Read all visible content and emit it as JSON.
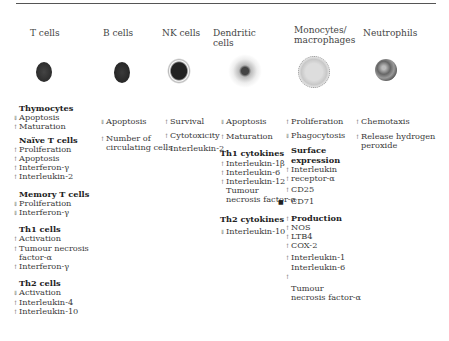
{
  "figure": {
    "columns": [
      {
        "id": "t-cells",
        "title": "T cells",
        "groups": [
          {
            "heading": "Thymocytes",
            "items": [
              {
                "arrow": "down",
                "label": "Apoptosis"
              },
              {
                "arrow": "up",
                "label": "Maturation"
              }
            ]
          },
          {
            "heading": "Naïve T cells",
            "items": [
              {
                "arrow": "up",
                "label": "Proliferation"
              },
              {
                "arrow": "up",
                "label": "Apoptosis"
              },
              {
                "arrow": "up",
                "label": "Interferon-γ"
              },
              {
                "arrow": "up",
                "label": "Interleukin-2"
              }
            ]
          },
          {
            "heading": "Memory T cells",
            "items": [
              {
                "arrow": "down",
                "label": "Proliferation"
              },
              {
                "arrow": "down",
                "label": "Interferon-γ"
              }
            ]
          },
          {
            "heading": "Th1 cells",
            "items": [
              {
                "arrow": "up",
                "label": "Activation"
              },
              {
                "arrow": "up",
                "label": "Tumour necrosis"
              },
              {
                "arrow": "",
                "label": "factor-α"
              },
              {
                "arrow": "up",
                "label": "Interferon-γ"
              }
            ]
          },
          {
            "heading": "Th2 cells",
            "items": [
              {
                "arrow": "down",
                "label": "Activation"
              },
              {
                "arrow": "up",
                "label": "Interleukin-4"
              },
              {
                "arrow": "up",
                "label": "Interleukin-10"
              }
            ]
          }
        ]
      },
      {
        "id": "b-cells",
        "title": "B cells",
        "items": [
          {
            "arrow": "down",
            "label": "Apoptosis"
          },
          {
            "arrow": "up",
            "label": "Number of"
          },
          {
            "arrow": "",
            "label": "circulating cells"
          }
        ]
      },
      {
        "id": "nk-cells",
        "title": "NK cells",
        "items": [
          {
            "arrow": "up",
            "label": "Survival"
          },
          {
            "arrow": "up",
            "label": "Cytotoxicity"
          },
          {
            "arrow": "up",
            "label": "Interleukin-2"
          }
        ]
      },
      {
        "id": "dendritic-cells",
        "title_line1": "Dendritic",
        "title_line2": "cells",
        "items": [
          {
            "arrow": "down",
            "label": "Apoptosis"
          },
          {
            "arrow": "up",
            "label": "Maturation"
          }
        ],
        "groups": [
          {
            "heading": "Th1 cytokines",
            "items": [
              {
                "arrow": "up",
                "label": "Interleukin-1β"
              },
              {
                "arrow": "up",
                "label": "Interleukin-6"
              },
              {
                "arrow": "up",
                "label": "Interleukin-12"
              },
              {
                "arrow": "",
                "label": "Tumour"
              },
              {
                "arrow": "",
                "label": "necrosis factor-α"
              }
            ]
          },
          {
            "heading": "Th2 cytokines",
            "items": [
              {
                "arrow": "down",
                "label": "Interleukin-10"
              }
            ]
          }
        ]
      },
      {
        "id": "monocytes-macrophages",
        "title_line1": "Monocytes/",
        "title_line2": "macrophages",
        "items": [
          {
            "arrow": "up",
            "label": "Proliferation"
          },
          {
            "arrow": "down",
            "label": "Phagocytosis"
          }
        ],
        "groups": [
          {
            "heading_line1": "Surface",
            "heading_line2": "expression",
            "items": [
              {
                "arrow": "up",
                "label": "Interleukin"
              },
              {
                "arrow": "up",
                "label": "receptor-α"
              },
              {
                "arrow": "up",
                "label": "CD25"
              },
              {
                "arrow": "",
                "label": "CD71"
              }
            ]
          },
          {
            "heading": "Production",
            "heading_arrow": "up",
            "items": [
              {
                "arrow": "up",
                "label": "NOS"
              },
              {
                "arrow": "up",
                "label": "LTB4"
              },
              {
                "arrow": "up",
                "label": "COX-2"
              },
              {
                "arrow": "up",
                "label": "Interleukin-1"
              },
              {
                "arrow": "",
                "label": "Interleukin-6"
              },
              {
                "arrow": "up",
                "label": ""
              },
              {
                "arrow": "",
                "label": "Tumour"
              },
              {
                "arrow": "",
                "label": "necrosis factor-α"
              }
            ]
          }
        ]
      },
      {
        "id": "neutrophils",
        "title": "Neutrophils",
        "items": [
          {
            "arrow": "up",
            "label": "Chemotaxis"
          },
          {
            "arrow": "up",
            "label": "Release hydrogen"
          },
          {
            "arrow": "",
            "label": "peroxide"
          }
        ]
      }
    ],
    "colors": {
      "rule": "#555555",
      "text": "#3a3a3a",
      "cell_dark": "#2e2e2e",
      "cell_light": "#d8d8d8"
    }
  }
}
